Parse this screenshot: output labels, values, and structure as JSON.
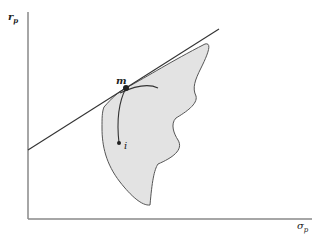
{
  "diagram": {
    "y_axis_label": "r",
    "y_axis_subscript": "p",
    "x_axis_label": "σ",
    "x_axis_subscript": "p",
    "points": [
      {
        "id": "m",
        "label": "m",
        "description": "market portfolio tangency point"
      },
      {
        "id": "i",
        "label": "i",
        "description": "individual asset"
      }
    ],
    "elements": [
      "feasible set (shaded region)",
      "capital market line (tangent line)",
      "curve from i to m",
      "curve through m"
    ],
    "colors": {
      "region_fill": "#e3e3e3",
      "region_stroke": "#555555",
      "axis": "#777777",
      "line": "#333333",
      "point": "#222222"
    }
  }
}
